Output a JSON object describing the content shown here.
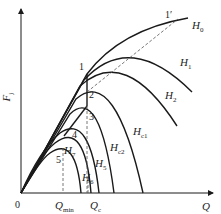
{
  "axes": {
    "y_label": "F",
    "y_label_sub": "j",
    "x_label": "Q",
    "origin": "0",
    "qmin_label": "Q",
    "qmin_sub": "min",
    "qc_label": "Q",
    "qc_sub": "c"
  },
  "curves": [
    {
      "name": "H",
      "sub": "0"
    },
    {
      "name": "H",
      "sub": "1"
    },
    {
      "name": "H",
      "sub": "2"
    },
    {
      "name": "H",
      "sub": "c1"
    },
    {
      "name": "H",
      "sub": "c2"
    },
    {
      "name": "H",
      "sub": "5"
    },
    {
      "name": "H",
      "sub": "6"
    },
    {
      "name": "H",
      "sub": "7"
    }
  ],
  "points": [
    "1",
    "1′",
    "2",
    "3",
    "4",
    "5"
  ],
  "colors": {
    "line": "#1a1a1a",
    "dashed": "#555555"
  }
}
